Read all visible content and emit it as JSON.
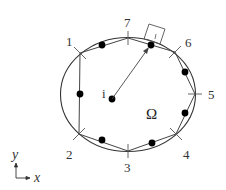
{
  "diagram": {
    "region_label": "Ω",
    "center_label": "i",
    "vertices": [
      {
        "label": "1",
        "x": 80,
        "y": 53
      },
      {
        "label": "2",
        "x": 79,
        "y": 134
      },
      {
        "label": "3",
        "x": 128,
        "y": 151
      },
      {
        "label": "4",
        "x": 176,
        "y": 134
      },
      {
        "label": "5",
        "x": 195,
        "y": 94
      },
      {
        "label": "6",
        "x": 175,
        "y": 52
      },
      {
        "label": "7",
        "x": 128,
        "y": 38
      }
    ],
    "axes": {
      "x_label": "x",
      "y_label": "y"
    }
  }
}
